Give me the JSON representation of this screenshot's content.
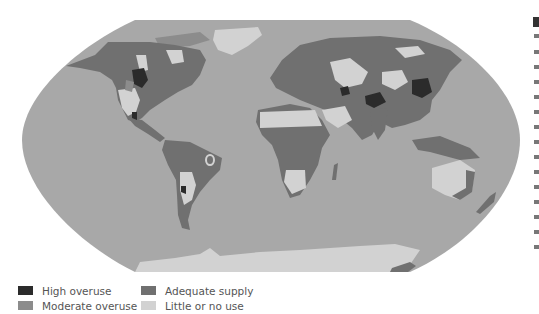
{
  "map": {
    "projection": "robinson",
    "subject": "Groundwater use by region",
    "colors": {
      "ocean": "#a8a8a8",
      "adequate_supply": "#707070",
      "little_or_no_use": "#d2d2d2",
      "moderate_overuse": "#8c8c8c",
      "high_overuse": "#2b2b2b",
      "outline": "#9a9a9a"
    }
  },
  "legend": {
    "items": [
      {
        "label": "High overuse",
        "color": "#2b2b2b"
      },
      {
        "label": "Moderate overuse",
        "color": "#8c8c8c"
      },
      {
        "label": "Adequate supply",
        "color": "#707070"
      },
      {
        "label": "Little or no use",
        "color": "#d2d2d2"
      }
    ]
  }
}
